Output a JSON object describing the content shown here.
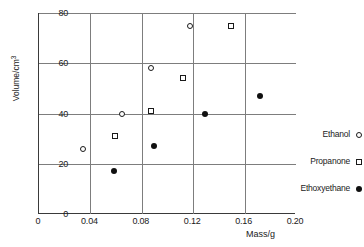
{
  "chart_data": {
    "type": "scatter",
    "title": "",
    "xlabel": "Mass/g",
    "ylabel": "Volume/cm3",
    "ylabel_base": "Volume/cm",
    "ylabel_exponent": "3",
    "xlim": [
      0,
      0.2
    ],
    "ylim": [
      0,
      80
    ],
    "xticks": [
      0,
      0.04,
      0.08,
      0.12,
      0.16,
      0.2
    ],
    "xticklabels": [
      "0",
      "0.04",
      "0.08",
      "0.12",
      "0.16",
      "0.20"
    ],
    "yticks": [
      0,
      20,
      40,
      60,
      80
    ],
    "yticklabels": [
      "0",
      "20",
      "40",
      "60",
      "80"
    ],
    "grid": true,
    "gridlines_x": [
      0.04,
      0.08,
      0.12,
      0.16
    ],
    "gridlines_y": [
      20,
      40,
      60,
      80
    ],
    "legend_position": "right",
    "series": [
      {
        "name": "Ethanol",
        "marker": "open-circle",
        "color": "#1a1a1a",
        "points": [
          {
            "x": 0.035,
            "y": 26
          },
          {
            "x": 0.065,
            "y": 40
          },
          {
            "x": 0.088,
            "y": 58
          },
          {
            "x": 0.118,
            "y": 75
          }
        ]
      },
      {
        "name": "Propanone",
        "marker": "open-square",
        "color": "#1a1a1a",
        "points": [
          {
            "x": 0.06,
            "y": 31
          },
          {
            "x": 0.088,
            "y": 41
          },
          {
            "x": 0.113,
            "y": 54
          },
          {
            "x": 0.15,
            "y": 75
          }
        ]
      },
      {
        "name": "Ethoxyethane",
        "marker": "filled-circle",
        "color": "#101010",
        "points": [
          {
            "x": 0.059,
            "y": 17
          },
          {
            "x": 0.09,
            "y": 27
          },
          {
            "x": 0.13,
            "y": 40
          },
          {
            "x": 0.173,
            "y": 47
          }
        ]
      }
    ]
  },
  "legend": {
    "items": [
      {
        "label": "Ethanol",
        "marker": "open-circle"
      },
      {
        "label": "Propanone",
        "marker": "open-square"
      },
      {
        "label": "Ethoxyethane",
        "marker": "filled-circle"
      }
    ]
  },
  "caption": {
    "text": ""
  }
}
